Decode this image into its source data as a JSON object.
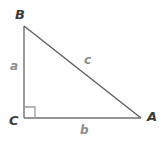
{
  "figure": {
    "type": "right-triangle-diagram",
    "background_color": "#ffffff",
    "stroke_color": "#707070",
    "vertex_label_color": "#3b3b3b",
    "side_label_color": "#8d8d8d",
    "vertices": [
      {
        "id": "B",
        "label": "B",
        "x": 24,
        "y": 26,
        "role": "top-left-vertex"
      },
      {
        "id": "C",
        "label": "C",
        "x": 24,
        "y": 118,
        "role": "right-angle-vertex"
      },
      {
        "id": "A",
        "label": "A",
        "x": 141,
        "y": 118,
        "role": "bottom-right-vertex"
      }
    ],
    "sides": [
      {
        "id": "a",
        "label": "a",
        "from": "B",
        "to": "C",
        "role": "vertical-leg"
      },
      {
        "id": "b",
        "label": "b",
        "from": "C",
        "to": "A",
        "role": "horizontal-leg"
      },
      {
        "id": "c",
        "label": "c",
        "from": "B",
        "to": "A",
        "role": "hypotenuse"
      }
    ],
    "right_angle_marker": {
      "at_vertex": "C",
      "size": 11
    }
  }
}
